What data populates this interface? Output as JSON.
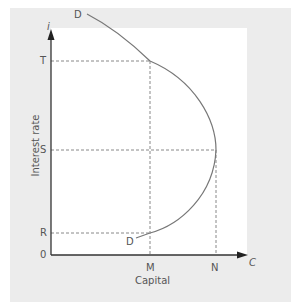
{
  "diagram": {
    "y_axis_symbol": "i",
    "x_axis_symbol": "C",
    "y_axis_label": "Interest rate",
    "x_axis_label": "Capital",
    "origin_label": "0",
    "y_ticks": [
      "T",
      "S",
      "R"
    ],
    "x_ticks": [
      "M",
      "N"
    ],
    "curve_labels": {
      "top": "D",
      "bottom": "D"
    }
  },
  "colors": {
    "panel": "#ececec",
    "plot": "#ffffff",
    "axis": "#333333",
    "curve": "#777777",
    "dash": "#888888"
  }
}
